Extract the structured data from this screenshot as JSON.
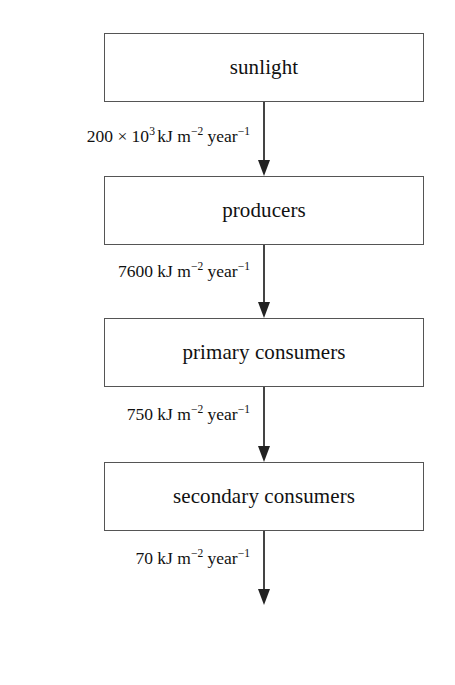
{
  "diagram": {
    "type": "energy-flow-chain",
    "title": "",
    "nodes": [
      {
        "id": "sunlight",
        "label": "sunlight",
        "x": 104,
        "y": 33,
        "width": 320,
        "height": 69
      },
      {
        "id": "producers",
        "label": "producers",
        "x": 104,
        "y": 176,
        "width": 320,
        "height": 69
      },
      {
        "id": "primary-consumers",
        "label": "primary consumers",
        "x": 104,
        "y": 318,
        "width": 320,
        "height": 69
      },
      {
        "id": "secondary-consumers",
        "label": "secondary consumers",
        "x": 104,
        "y": 462,
        "width": 320,
        "height": 69
      },
      {
        "id": "tertiary-consumers",
        "label": "tertiary consumers",
        "x": 104,
        "y": 605,
        "width": 320,
        "height": 67
      }
    ],
    "flows": [
      {
        "from": "sunlight",
        "to": "producers",
        "value": "200 × 10",
        "value_exponent": "3",
        "value_tail": "",
        "unit_kj": "kJ m",
        "unit_exp_m": "−2",
        "unit_year": "year",
        "unit_exp_year": "−1",
        "full_text": "200 × 10³ kJ m⁻² year⁻¹",
        "numeric_value": 200000,
        "unit": "kJ m^-2 year^-1",
        "label_y": 128,
        "arrow_top": 102,
        "arrow_bottom": 176
      },
      {
        "from": "producers",
        "to": "primary-consumers",
        "value": "7600 ",
        "value_exponent": "",
        "value_tail": "",
        "unit_kj": "kJ m",
        "unit_exp_m": "−2",
        "unit_year": "year",
        "unit_exp_year": "−1",
        "full_text": "7600 kJ m⁻² year⁻¹",
        "numeric_value": 7600,
        "unit": "kJ m^-2 year^-1",
        "label_y": 263,
        "arrow_top": 245,
        "arrow_bottom": 318
      },
      {
        "from": "primary-consumers",
        "to": "secondary-consumers",
        "value": "750 ",
        "value_exponent": "",
        "value_tail": "",
        "unit_kj": "kJ m",
        "unit_exp_m": "−2",
        "unit_year": "year",
        "unit_exp_year": "−1",
        "full_text": "750 kJ m⁻² year⁻¹",
        "numeric_value": 750,
        "unit": "kJ m^-2 year^-1",
        "label_y": 406,
        "arrow_top": 387,
        "arrow_bottom": 462
      },
      {
        "from": "secondary-consumers",
        "to": "tertiary-consumers",
        "value": "70 ",
        "value_exponent": "",
        "value_tail": "",
        "unit_kj": "kJ m",
        "unit_exp_m": "−2",
        "unit_year": "year",
        "unit_exp_year": "−1",
        "full_text": "70 kJ m⁻² year⁻¹",
        "numeric_value": 70,
        "unit": "kJ m^-2 year^-1",
        "label_y": 550,
        "arrow_top": 531,
        "arrow_bottom": 605
      }
    ],
    "colors": {
      "box_border": "#555555",
      "box_fill": "#ffffff",
      "text": "#111111",
      "arrow": "#333333",
      "background": "#ffffff"
    }
  }
}
